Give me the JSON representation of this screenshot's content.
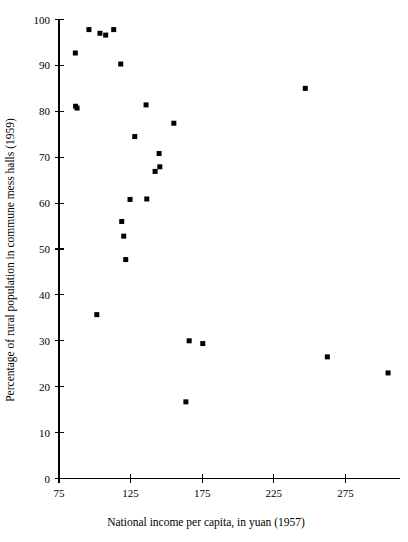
{
  "chart_data": {
    "type": "scatter",
    "title": "",
    "xlabel": "National income per capita, in yuan (1957)",
    "ylabel": "Percentage of rural population in commune mess halls (1959)",
    "xlim": [
      75,
      305
    ],
    "ylim": [
      0,
      100
    ],
    "xticks": [
      75,
      125,
      175,
      225,
      275
    ],
    "yticks": [
      0,
      10,
      20,
      30,
      40,
      50,
      60,
      70,
      80,
      90,
      100
    ],
    "xtick_labels": [
      "75",
      "125",
      "175",
      "225",
      "275"
    ],
    "ytick_labels": [
      "0",
      "10",
      "20",
      "30",
      "40",
      "50",
      "60",
      "70",
      "80",
      "90",
      "100"
    ],
    "grid": false,
    "legend": null,
    "marker": "square",
    "marker_color": "#000000",
    "marker_size": 5,
    "points": [
      {
        "x": 86.4,
        "y": 92.7
      },
      {
        "x": 86.6,
        "y": 81.1
      },
      {
        "x": 87.6,
        "y": 80.7
      },
      {
        "x": 95.9,
        "y": 97.8
      },
      {
        "x": 103.6,
        "y": 97.0
      },
      {
        "x": 107.6,
        "y": 96.6
      },
      {
        "x": 113.2,
        "y": 97.8
      },
      {
        "x": 118.1,
        "y": 90.3
      },
      {
        "x": 101.4,
        "y": 35.7
      },
      {
        "x": 118.8,
        "y": 56.0
      },
      {
        "x": 120.2,
        "y": 52.8
      },
      {
        "x": 121.6,
        "y": 47.7
      },
      {
        "x": 124.6,
        "y": 60.8
      },
      {
        "x": 127.9,
        "y": 74.5
      },
      {
        "x": 135.8,
        "y": 81.4
      },
      {
        "x": 136.3,
        "y": 60.9
      },
      {
        "x": 142.1,
        "y": 66.9
      },
      {
        "x": 145.4,
        "y": 67.9
      },
      {
        "x": 144.9,
        "y": 70.8
      },
      {
        "x": 155.2,
        "y": 77.4
      },
      {
        "x": 163.6,
        "y": 16.7
      },
      {
        "x": 165.9,
        "y": 30.0
      },
      {
        "x": 175.4,
        "y": 29.4
      },
      {
        "x": 247.0,
        "y": 85.0
      },
      {
        "x": 262.4,
        "y": 26.5
      },
      {
        "x": 304.8,
        "y": 23.0
      }
    ]
  }
}
